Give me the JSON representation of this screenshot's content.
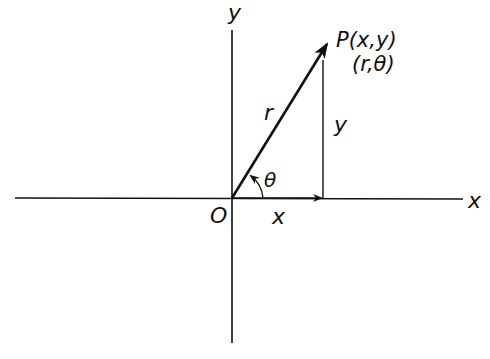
{
  "diagram": {
    "type": "polar-cartesian-coordinates",
    "colors": {
      "stroke": "#111111",
      "background": "#ffffff"
    },
    "labels": {
      "y_axis": "y",
      "x_axis": "x",
      "origin": "O",
      "point_cartesian": "P(x,y)",
      "point_polar": "(r,θ)",
      "radius": "r",
      "angle": "θ",
      "x_component": "x",
      "y_component": "y"
    }
  }
}
